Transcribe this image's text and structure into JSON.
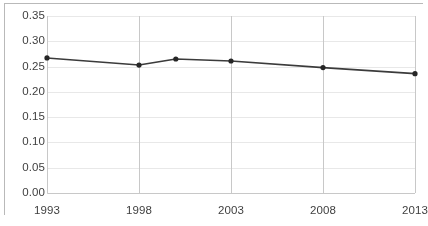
{
  "chart_data": {
    "type": "line",
    "title": "",
    "subtitle": "",
    "xlabel": "",
    "ylabel": "",
    "x": [
      1993,
      1998,
      2000,
      2003,
      2008,
      2013
    ],
    "values": [
      0.267,
      0.253,
      0.265,
      0.261,
      0.248,
      0.236
    ],
    "series": [
      {
        "name": "",
        "x": [
          1993,
          1998,
          2000,
          2003,
          2008,
          2013
        ],
        "values": [
          0.267,
          0.253,
          0.265,
          0.261,
          0.248,
          0.236
        ]
      }
    ],
    "xlim": [
      1993,
      2013
    ],
    "ylim": [
      0.0,
      0.35
    ],
    "xticks": [
      1993,
      1998,
      2003,
      2008,
      2013
    ],
    "xtick_labels": [
      "1993",
      "1998",
      "2003",
      "2008",
      "2013"
    ],
    "yticks": [
      0.0,
      0.05,
      0.1,
      0.15,
      0.2,
      0.25,
      0.3,
      0.35
    ],
    "ytick_labels": [
      "0.00",
      "0.05",
      "0.10",
      "0.15",
      "0.20",
      "0.25",
      "0.30",
      "0.35"
    ],
    "grid": {
      "vertical": true,
      "horizontal": true
    },
    "legend": {
      "visible": false,
      "position": "none",
      "entries": []
    },
    "annotations": [],
    "style": {
      "line_color": "#3b3b3b",
      "marker_color": "#262626",
      "marker_shape": "circle",
      "grid_color": "#e8e8e8",
      "axis_color": "#c8c8c8",
      "border_color": "#b9b9b9",
      "background_color": "#ffffff",
      "tick_label_color": "#3f3f3f"
    }
  }
}
